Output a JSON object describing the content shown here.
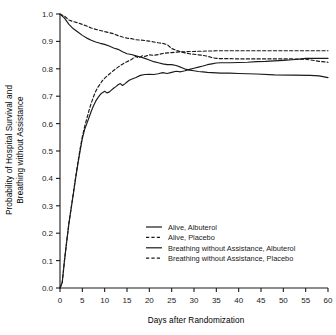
{
  "chart_data": {
    "type": "line",
    "title": "",
    "xlabel": "Days after Randomization",
    "ylabel_line1": "Probability of Hospital Survival and",
    "ylabel_line2": "Breathing without Assistance",
    "xlim": [
      0,
      60
    ],
    "ylim": [
      0.0,
      1.0
    ],
    "xticks": [
      0,
      5,
      10,
      15,
      20,
      25,
      30,
      35,
      40,
      45,
      50,
      55,
      60
    ],
    "yticks": [
      "0.0",
      "0.1",
      "0.2",
      "0.3",
      "0.4",
      "0.5",
      "0.6",
      "0.7",
      "0.8",
      "0.9",
      "1.0"
    ],
    "grid": false,
    "legend_position": "center",
    "series": [
      {
        "name": "Alive, Albuterol",
        "style": "solid",
        "color": "#1a1a1a",
        "points": [
          [
            0,
            1.0
          ],
          [
            1,
            0.985
          ],
          [
            2,
            0.962
          ],
          [
            3,
            0.946
          ],
          [
            4,
            0.934
          ],
          [
            5,
            0.922
          ],
          [
            6,
            0.912
          ],
          [
            7,
            0.904
          ],
          [
            8,
            0.898
          ],
          [
            9,
            0.893
          ],
          [
            10,
            0.889
          ],
          [
            11,
            0.883
          ],
          [
            12,
            0.876
          ],
          [
            13,
            0.871
          ],
          [
            14,
            0.862
          ],
          [
            15,
            0.855
          ],
          [
            16,
            0.852
          ],
          [
            17,
            0.847
          ],
          [
            18,
            0.843
          ],
          [
            19,
            0.838
          ],
          [
            20,
            0.832
          ],
          [
            21,
            0.826
          ],
          [
            22,
            0.822
          ],
          [
            23,
            0.818
          ],
          [
            24,
            0.815
          ],
          [
            25,
            0.815
          ],
          [
            26,
            0.812
          ],
          [
            27,
            0.806
          ],
          [
            28,
            0.799
          ],
          [
            29,
            0.795
          ],
          [
            30,
            0.793
          ],
          [
            31,
            0.79
          ],
          [
            32,
            0.789
          ],
          [
            33,
            0.787
          ],
          [
            34,
            0.786
          ],
          [
            36,
            0.784
          ],
          [
            38,
            0.784
          ],
          [
            40,
            0.783
          ],
          [
            44,
            0.781
          ],
          [
            48,
            0.778
          ],
          [
            52,
            0.777
          ],
          [
            56,
            0.776
          ],
          [
            58,
            0.774
          ],
          [
            60,
            0.768
          ]
        ]
      },
      {
        "name": "Alive, Placebo",
        "style": "dashed",
        "color": "#1a1a1a",
        "points": [
          [
            0,
            1.0
          ],
          [
            1,
            0.992
          ],
          [
            2,
            0.978
          ],
          [
            3,
            0.972
          ],
          [
            4,
            0.968
          ],
          [
            5,
            0.962
          ],
          [
            6,
            0.956
          ],
          [
            7,
            0.949
          ],
          [
            8,
            0.944
          ],
          [
            9,
            0.94
          ],
          [
            10,
            0.936
          ],
          [
            11,
            0.932
          ],
          [
            12,
            0.928
          ],
          [
            13,
            0.921
          ],
          [
            14,
            0.916
          ],
          [
            15,
            0.912
          ],
          [
            16,
            0.91
          ],
          [
            17,
            0.906
          ],
          [
            18,
            0.905
          ],
          [
            19,
            0.903
          ],
          [
            20,
            0.901
          ],
          [
            21,
            0.898
          ],
          [
            22,
            0.895
          ],
          [
            23,
            0.893
          ],
          [
            24,
            0.888
          ],
          [
            25,
            0.874
          ],
          [
            26,
            0.868
          ],
          [
            27,
            0.862
          ],
          [
            28,
            0.858
          ],
          [
            29,
            0.855
          ],
          [
            30,
            0.853
          ],
          [
            31,
            0.851
          ],
          [
            32,
            0.849
          ],
          [
            33,
            0.846
          ],
          [
            34,
            0.841
          ],
          [
            35,
            0.838
          ],
          [
            36,
            0.837
          ],
          [
            38,
            0.837
          ],
          [
            40,
            0.836
          ],
          [
            44,
            0.836
          ],
          [
            48,
            0.836
          ],
          [
            52,
            0.836
          ],
          [
            55,
            0.835
          ],
          [
            57,
            0.83
          ],
          [
            58,
            0.827
          ],
          [
            60,
            0.824
          ]
        ]
      },
      {
        "name": "Breathing without Assistance, Albuterol",
        "style": "solid",
        "color": "#1a1a1a",
        "points": [
          [
            0,
            0.0
          ],
          [
            0.5,
            0.02
          ],
          [
            1,
            0.1
          ],
          [
            1.5,
            0.17
          ],
          [
            2,
            0.235
          ],
          [
            2.5,
            0.29
          ],
          [
            3,
            0.345
          ],
          [
            3.5,
            0.4
          ],
          [
            4,
            0.452
          ],
          [
            4.5,
            0.5
          ],
          [
            5,
            0.545
          ],
          [
            5.5,
            0.578
          ],
          [
            6,
            0.6
          ],
          [
            6.5,
            0.622
          ],
          [
            7,
            0.645
          ],
          [
            7.5,
            0.665
          ],
          [
            8,
            0.682
          ],
          [
            8.5,
            0.695
          ],
          [
            9,
            0.706
          ],
          [
            9.5,
            0.713
          ],
          [
            10,
            0.718
          ],
          [
            10.5,
            0.712
          ],
          [
            11,
            0.715
          ],
          [
            11.5,
            0.722
          ],
          [
            12,
            0.729
          ],
          [
            12.5,
            0.735
          ],
          [
            13,
            0.742
          ],
          [
            13.5,
            0.746
          ],
          [
            14,
            0.739
          ],
          [
            14.5,
            0.745
          ],
          [
            15,
            0.752
          ],
          [
            15.5,
            0.758
          ],
          [
            16,
            0.762
          ],
          [
            17,
            0.768
          ],
          [
            18,
            0.776
          ],
          [
            19,
            0.779
          ],
          [
            20,
            0.78
          ],
          [
            21,
            0.779
          ],
          [
            22,
            0.782
          ],
          [
            23,
            0.786
          ],
          [
            24,
            0.783
          ],
          [
            25,
            0.787
          ],
          [
            26,
            0.791
          ],
          [
            27,
            0.789
          ],
          [
            28,
            0.793
          ],
          [
            29,
            0.798
          ],
          [
            30,
            0.802
          ],
          [
            31,
            0.806
          ],
          [
            32,
            0.81
          ],
          [
            33,
            0.815
          ],
          [
            34,
            0.818
          ],
          [
            35,
            0.821
          ],
          [
            36,
            0.822
          ],
          [
            38,
            0.822
          ],
          [
            40,
            0.823
          ],
          [
            42,
            0.824
          ],
          [
            44,
            0.826
          ],
          [
            46,
            0.827
          ],
          [
            48,
            0.829
          ],
          [
            50,
            0.831
          ],
          [
            52,
            0.833
          ],
          [
            54,
            0.836
          ],
          [
            55,
            0.838
          ],
          [
            56,
            0.838
          ],
          [
            58,
            0.838
          ],
          [
            60,
            0.838
          ]
        ]
      },
      {
        "name": "Breathing without Assistance, Placebo",
        "style": "dashed",
        "color": "#1a1a1a",
        "points": [
          [
            0,
            0.0
          ],
          [
            0.5,
            0.02
          ],
          [
            1,
            0.1
          ],
          [
            1.5,
            0.17
          ],
          [
            2,
            0.238
          ],
          [
            2.5,
            0.293
          ],
          [
            3,
            0.348
          ],
          [
            3.5,
            0.405
          ],
          [
            4,
            0.458
          ],
          [
            4.5,
            0.508
          ],
          [
            5,
            0.552
          ],
          [
            5.5,
            0.588
          ],
          [
            6,
            0.618
          ],
          [
            6.5,
            0.648
          ],
          [
            7,
            0.675
          ],
          [
            7.5,
            0.698
          ],
          [
            8,
            0.718
          ],
          [
            8.5,
            0.733
          ],
          [
            9,
            0.745
          ],
          [
            9.5,
            0.757
          ],
          [
            10,
            0.766
          ],
          [
            10.5,
            0.773
          ],
          [
            11,
            0.78
          ],
          [
            11.5,
            0.787
          ],
          [
            12,
            0.794
          ],
          [
            12.5,
            0.8
          ],
          [
            13,
            0.806
          ],
          [
            13.5,
            0.812
          ],
          [
            14,
            0.817
          ],
          [
            14.5,
            0.822
          ],
          [
            15,
            0.826
          ],
          [
            15.5,
            0.83
          ],
          [
            16,
            0.834
          ],
          [
            16.5,
            0.84
          ],
          [
            17,
            0.846
          ],
          [
            17.5,
            0.84
          ],
          [
            18,
            0.843
          ],
          [
            18.5,
            0.848
          ],
          [
            19,
            0.845
          ],
          [
            19.5,
            0.848
          ],
          [
            20,
            0.851
          ],
          [
            21,
            0.849
          ],
          [
            22,
            0.852
          ],
          [
            23,
            0.856
          ],
          [
            24,
            0.858
          ],
          [
            25,
            0.859
          ],
          [
            26,
            0.861
          ],
          [
            27,
            0.862
          ],
          [
            28,
            0.862
          ],
          [
            29,
            0.863
          ],
          [
            30,
            0.863
          ],
          [
            31,
            0.864
          ],
          [
            32,
            0.864
          ],
          [
            33,
            0.865
          ],
          [
            34,
            0.865
          ],
          [
            35,
            0.866
          ],
          [
            36,
            0.866
          ],
          [
            40,
            0.866
          ],
          [
            44,
            0.866
          ],
          [
            48,
            0.866
          ],
          [
            52,
            0.866
          ],
          [
            56,
            0.866
          ],
          [
            58,
            0.866
          ],
          [
            60,
            0.866
          ]
        ]
      }
    ],
    "legend": [
      {
        "label": "Alive, Albuterol",
        "style": "solid"
      },
      {
        "label": "Alive, Placebo",
        "style": "dashed"
      },
      {
        "label": "Breathing without Assistance, Albuterol",
        "style": "solid"
      },
      {
        "label": "Breathing without Assistance, Placebo",
        "style": "dashed"
      }
    ]
  }
}
